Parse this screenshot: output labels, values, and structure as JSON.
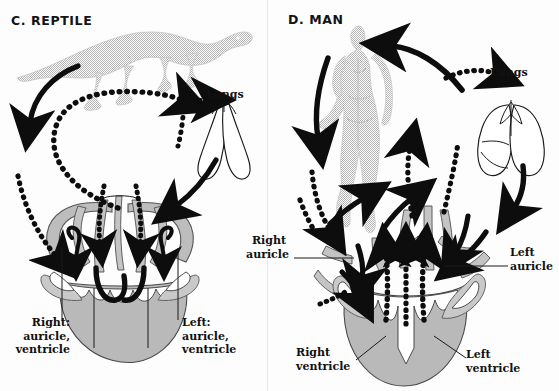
{
  "figure": {
    "caption_kind": "comparative-circulation-diagram",
    "background_color": "#ffffff",
    "ink_color": "#0d0d0d",
    "tissue_color": "#bdbdbd"
  },
  "panels": [
    {
      "id": "reptile",
      "title": "C. REPTILE",
      "animal_label": "reptile-silhouette",
      "organs": [
        {
          "name": "lungs",
          "label": "Lungs"
        },
        {
          "name": "heart",
          "label": ""
        }
      ],
      "labels": [
        {
          "name": "right-chambers",
          "text": "Right:\nauricle,\nventricle"
        },
        {
          "name": "left-chambers",
          "text": "Left:\nauricle,\nventricle"
        }
      ],
      "flow_arrows": [
        {
          "name": "body-to-heart-deoxygenated",
          "style": "solid",
          "direction": "down-left"
        },
        {
          "name": "heart-to-body-mixed",
          "style": "dotted",
          "direction": "up-left"
        },
        {
          "name": "heart-to-lungs",
          "style": "dotted",
          "direction": "right"
        },
        {
          "name": "lungs-to-heart",
          "style": "solid",
          "direction": "down-left"
        },
        {
          "name": "right-auricle-inflow",
          "style": "solid",
          "direction": "down"
        },
        {
          "name": "left-auricle-inflow",
          "style": "solid",
          "direction": "down"
        },
        {
          "name": "ventricle-outflow-left",
          "style": "dotted",
          "direction": "up"
        },
        {
          "name": "ventricle-outflow-right",
          "style": "dotted",
          "direction": "up"
        }
      ]
    },
    {
      "id": "man",
      "title": "D. MAN",
      "animal_label": "human-silhouette",
      "organs": [
        {
          "name": "lungs",
          "label": "Lungs"
        },
        {
          "name": "heart",
          "label": ""
        }
      ],
      "labels": [
        {
          "name": "right-auricle",
          "text": "Right\nauricle"
        },
        {
          "name": "left-auricle",
          "text": "Left\nauricle"
        },
        {
          "name": "right-ventricle",
          "text": "Right\nventricle"
        },
        {
          "name": "left-ventricle",
          "text": "Left\nventricle"
        }
      ],
      "flow_arrows": [
        {
          "name": "heart-to-body-oxygenated",
          "style": "solid",
          "direction": "up-left"
        },
        {
          "name": "body-to-heart-deoxygenated",
          "style": "solid",
          "direction": "down-left"
        },
        {
          "name": "heart-to-lungs",
          "style": "dotted",
          "direction": "right"
        },
        {
          "name": "lungs-to-heart",
          "style": "solid",
          "direction": "down"
        },
        {
          "name": "venous-return-to-right-auricle",
          "style": "dotted",
          "direction": "up-right"
        },
        {
          "name": "pulmonary-return-to-left-auricle",
          "style": "dotted",
          "direction": "up"
        },
        {
          "name": "right-ventricle-outflow",
          "style": "solid",
          "direction": "up"
        },
        {
          "name": "left-ventricle-outflow",
          "style": "solid",
          "direction": "up"
        },
        {
          "name": "left-auricle-inflow",
          "style": "solid",
          "direction": "down-left"
        }
      ]
    }
  ],
  "legend_note": ""
}
